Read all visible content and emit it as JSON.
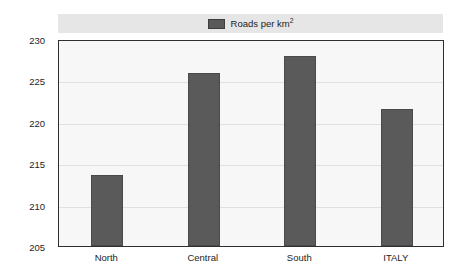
{
  "chart_data": {
    "type": "bar",
    "title": "",
    "subtitle": "",
    "xlabel": "",
    "ylabel": "",
    "categories": [
      "North",
      "Central",
      "South",
      "ITALY"
    ],
    "values": [
      213.6,
      225.9,
      228.0,
      221.5
    ],
    "series": [
      {
        "name": "Roads per km²",
        "values": [
          213.6,
          225.9,
          228.0,
          221.5
        ]
      }
    ],
    "ylim": [
      205,
      230
    ],
    "yticks": [
      205,
      210,
      215,
      220,
      225,
      230
    ],
    "ytick_labels": [
      "205",
      "210",
      "215",
      "220",
      "225",
      "230"
    ],
    "grid": true,
    "grid_axis": "y",
    "legend": {
      "position": "top",
      "entries": [
        {
          "label_main": "Roads per km",
          "label_sup": "2",
          "swatch_color": "#5a5a5a"
        }
      ]
    },
    "colors": {
      "bar_fill": "#5a5a5a",
      "bar_edge": "#4a4a4a",
      "plot_background": "#f7f7f7",
      "legend_band": "#e6e6e6",
      "frame": "#2e2e2e",
      "gridline": "#e0e0e0",
      "text": "#1d1d1d"
    }
  }
}
